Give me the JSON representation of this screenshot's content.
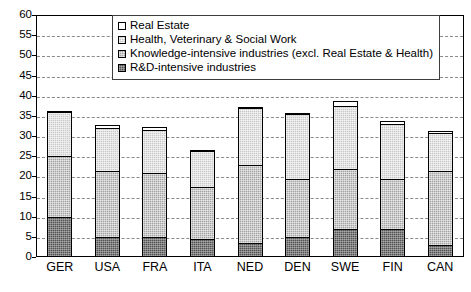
{
  "chart_data": {
    "type": "bar",
    "stacked": true,
    "title": "",
    "subtitle": "",
    "xlabel": "",
    "ylabel": "",
    "ylim": [
      0,
      60
    ],
    "ytick_step": 5,
    "yticks": [
      0,
      5,
      10,
      15,
      20,
      25,
      30,
      35,
      40,
      45,
      50,
      55,
      60
    ],
    "ytick_labels": [
      "0",
      "5",
      "10",
      "15",
      "20",
      "25",
      "30",
      "35",
      "40",
      "45",
      "50",
      "55",
      "60"
    ],
    "grid": true,
    "grid_axis": "y",
    "grid_style": "dashed",
    "legend_position": "top-center",
    "categories": [
      "GER",
      "USA",
      "FRA",
      "ITA",
      "NED",
      "DEN",
      "SWE",
      "FIN",
      "CAN"
    ],
    "series": [
      {
        "name": "R&D-intensive industries",
        "color": "#545454",
        "values": [
          10.0,
          5.0,
          5.0,
          4.5,
          3.5,
          5.0,
          7.0,
          7.0,
          3.0
        ]
      },
      {
        "name": "Knowledge-intensive industries (excl. Real Estate & Health)",
        "color": "#a2a2a2",
        "values": [
          15.3,
          16.5,
          16.0,
          13.2,
          19.5,
          14.5,
          15.0,
          12.5,
          18.5
        ]
      },
      {
        "name": "Health, Veterinary & Social Work",
        "color": "#c9c9c9",
        "values": [
          11.1,
          11.0,
          11.0,
          9.0,
          14.5,
          16.5,
          16.0,
          14.0,
          9.8
        ]
      },
      {
        "name": "Real Estate",
        "color": "#ffffff",
        "values": [
          0.6,
          1.0,
          1.0,
          0.3,
          0.5,
          0.5,
          1.5,
          1.0,
          0.7
        ]
      }
    ],
    "totals": [
      37.0,
      33.5,
      33.0,
      27.0,
      38.0,
      36.5,
      39.5,
      34.5,
      32.0
    ]
  },
  "legend": {
    "items": [
      {
        "label": "Real Estate",
        "swatch": "legend-swatch-real-estate",
        "color": "#ffffff"
      },
      {
        "label": "Health, Veterinary & Social Work",
        "swatch": "legend-swatch-health",
        "color": "#c9c9c9"
      },
      {
        "label": "Knowledge-intensive industries (excl. Real Estate & Health)",
        "swatch": "legend-swatch-knowledge",
        "color": "#a2a2a2"
      },
      {
        "label": "R&D-intensive industries",
        "swatch": "legend-swatch-rnd",
        "color": "#545454"
      }
    ]
  },
  "footer": {
    "note": ""
  }
}
